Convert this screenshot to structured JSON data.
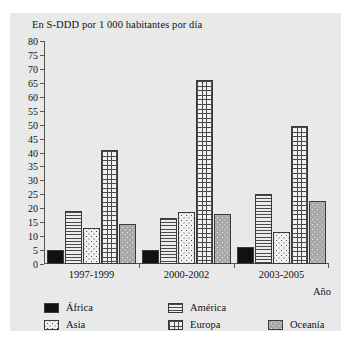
{
  "chart_data": {
    "type": "bar",
    "title": "",
    "ylabel": "En S-DDD por 1 000 habitantes por día",
    "xlabel": "Año",
    "ylim": [
      0,
      80
    ],
    "ystep": 5,
    "grid": false,
    "legend_position": "bottom",
    "categories": [
      "1997-1999",
      "2000-2002",
      "2003-2005"
    ],
    "yticks": [
      "80",
      "75",
      "70",
      "65",
      "60",
      "55",
      "50",
      "45",
      "40",
      "35",
      "30",
      "25",
      "20",
      "15",
      "10",
      "5",
      "0"
    ],
    "series": [
      {
        "name": "África",
        "pattern": "solid-black",
        "values": [
          5,
          5,
          6
        ]
      },
      {
        "name": "América",
        "pattern": "horizontal-lines",
        "values": [
          19,
          16.5,
          25
        ]
      },
      {
        "name": "Asia",
        "pattern": "dots-on-white",
        "values": [
          13,
          18.5,
          11.5
        ]
      },
      {
        "name": "Europa",
        "pattern": "grid-crosshatch",
        "values": [
          41,
          66,
          49.5
        ]
      },
      {
        "name": "Oceanía",
        "pattern": "dots-on-gray",
        "values": [
          14.5,
          18,
          22.5
        ]
      }
    ]
  },
  "legend": {
    "items": [
      {
        "label": "África",
        "swatch": "solid-black"
      },
      {
        "label": "América",
        "swatch": "horizontal-lines"
      },
      {
        "label": "Asia",
        "swatch": "dots-on-white"
      },
      {
        "label": "Europa",
        "swatch": "grid-crosshatch"
      },
      {
        "label": "Oceanía",
        "swatch": "dots-on-gray"
      }
    ]
  },
  "colors": {
    "panel_background": "#e9e9e9",
    "axis": "#555555",
    "bar_outline": "#3a3a3a",
    "text": "#111111",
    "africa": "#111111",
    "oceania_base": "#a8a8a8"
  }
}
